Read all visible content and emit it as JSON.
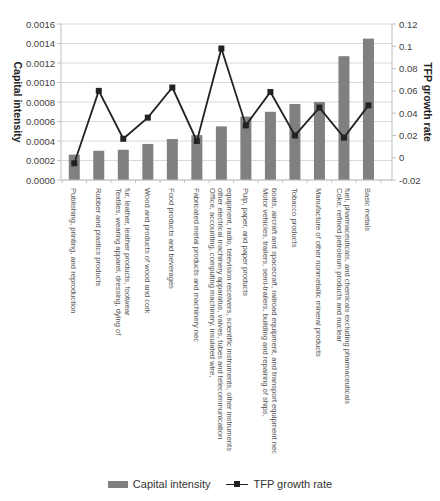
{
  "chart_data": {
    "type": "bar+line",
    "title": "",
    "categories": [
      "Publishing, printing, and reproduction",
      "Rubber and plastics products",
      "Textiles, wearing apparel, dressing, dying of fur, leather, leather products, footwear",
      "Wood and products of wood and cork",
      "Food products and beverages",
      "Fabricated metal products and machinery nec",
      "Office, accounting, computing machinery, insulated wire, other electrical machinery apparatus, valves, tubes and telecommunication equipment, radio, television receivers, scientific instruments, other instruments",
      "Pulp, paper, and paper products",
      "Motor vehicles, trailers, semi-trailers, building and repairing of ships, boats, aircraft and spacecraft, railroad equipment, and transport equipment nec",
      "Tobacco products",
      "Manufacture of other nonmetallic mineral products",
      "Coke, refined petroleum products and nuclear fuel, pharmaceuticals, and chemicals excluding pharmaceuticals",
      "Basic metals"
    ],
    "category_lines": [
      [
        "Publishing, printing, and reproduction"
      ],
      [
        "Rubber and plastics products"
      ],
      [
        "Textiles, wearing apparel, dressing, dying of",
        "fur, leather, leather products, footwear"
      ],
      [
        "Wood and products of wood and cork"
      ],
      [
        "Food products and beverages"
      ],
      [
        "Fabricated metal products and machinery nec"
      ],
      [
        "Office, accounting, computing machinery, insulated wire,",
        "other electrical machinery apparatus, valves, tubes and telecommunication",
        "equipment, radio, television receivers, scientific instruments, other instruments"
      ],
      [
        "Pulp, paper, and paper products"
      ],
      [
        "Motor vehicles, trailers, semi-trailers, building and repairing of ships,",
        "boats, aircraft and spacecraft, railroad equipment, and transport equipment nec"
      ],
      [
        "Tobacco products"
      ],
      [
        "Manufacture of other nonmetallic mineral products"
      ],
      [
        "Coke, refined petroleum products and nuclear",
        "fuel, pharmaceuticals, and chemicals excluding pharmaceuticals"
      ],
      [
        "Basic metals"
      ]
    ],
    "series": [
      {
        "name": "Capital intensity",
        "type": "bar",
        "axis": "left",
        "color": "#808080",
        "values": [
          0.00026,
          0.0003,
          0.00031,
          0.00037,
          0.00042,
          0.00046,
          0.00055,
          0.00065,
          0.0007,
          0.00078,
          0.0008,
          0.00127,
          0.00145
        ]
      },
      {
        "name": "TFP growth rate",
        "type": "line",
        "axis": "right",
        "color": "#222222",
        "marker": "square",
        "values": [
          -0.005,
          0.06,
          0.017,
          0.036,
          0.063,
          0.015,
          0.098,
          0.029,
          0.059,
          0.02,
          0.045,
          0.018,
          0.047
        ]
      }
    ],
    "ylabel": "Capital intensity",
    "ylabel_right": "TFP growth rate",
    "ylim": [
      0,
      0.0016
    ],
    "ylim_right": [
      -0.02,
      0.12
    ],
    "yticks": [
      "0.0000",
      "0.0002",
      "0.0004",
      "0.0006",
      "0.0008",
      "0.0010",
      "0.0012",
      "0.0014",
      "0.0016"
    ],
    "yticks_right": [
      "-0.02",
      "0",
      "0.02",
      "0.04",
      "0.06",
      "0.08",
      "0.1",
      "0.12"
    ],
    "grid": true,
    "legend_position": "bottom"
  },
  "legend": {
    "bar_label": "Capital intensity",
    "line_label": "TFP growth rate"
  }
}
